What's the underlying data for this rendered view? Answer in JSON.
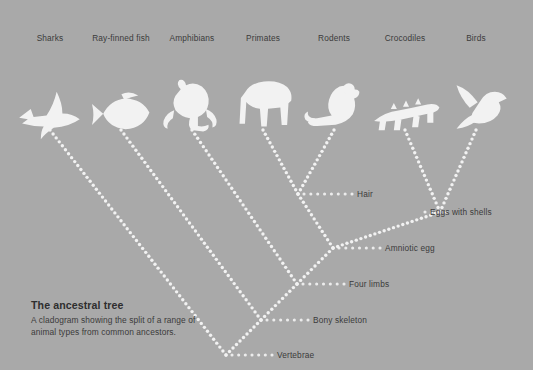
{
  "background_color": "#a9a9a9",
  "silhouette_color": "#f2f2f2",
  "text_color": "#3b3b3b",
  "caption": {
    "title": "The ancestral tree",
    "body": "A cladogram showing the split of a range of animal types from common ancestors."
  },
  "taxa": [
    {
      "label": "Sharks",
      "icon": "shark-silhouette",
      "x": 50
    },
    {
      "label": "Ray-finned fish",
      "icon": "fish-silhouette",
      "x": 121
    },
    {
      "label": "Amphibians",
      "icon": "frog-silhouette",
      "x": 192
    },
    {
      "label": "Primates",
      "icon": "primate-silhouette",
      "x": 263
    },
    {
      "label": "Rodents",
      "icon": "rodent-silhouette",
      "x": 334
    },
    {
      "label": "Crocodiles",
      "icon": "crocodile-silhouette",
      "x": 405
    },
    {
      "label": "Birds",
      "icon": "bird-silhouette",
      "x": 476
    }
  ],
  "nodes": [
    {
      "label": "Hair",
      "x": 298,
      "y": 194,
      "leader_end": 352
    },
    {
      "label": "Eggs with shells",
      "x": 440,
      "y": 212,
      "leader_end": 425
    },
    {
      "label": "Amniotic egg",
      "x": 333,
      "y": 248,
      "leader_end": 380
    },
    {
      "label": "Four limbs",
      "x": 297,
      "y": 284,
      "leader_end": 344
    },
    {
      "label": "Bony skeleton",
      "x": 261,
      "y": 320,
      "leader_end": 308
    },
    {
      "label": "Vertebrae",
      "x": 226,
      "y": 355,
      "leader_end": 272
    }
  ],
  "chart_data": {
    "type": "diagram",
    "diagram_type": "cladogram",
    "title": "The ancestral tree",
    "tip_y": 130,
    "taxa": [
      "Sharks",
      "Ray-finned fish",
      "Amphibians",
      "Primates",
      "Rodents",
      "Crocodiles",
      "Birds"
    ],
    "internal_nodes": [
      {
        "name": "Vertebrae",
        "x": 226,
        "y": 355,
        "children": [
          "Sharks",
          "Bony skeleton"
        ]
      },
      {
        "name": "Bony skeleton",
        "x": 261,
        "y": 320,
        "children": [
          "Ray-finned fish",
          "Four limbs"
        ]
      },
      {
        "name": "Four limbs",
        "x": 297,
        "y": 284,
        "children": [
          "Amphibians",
          "Amniotic egg"
        ]
      },
      {
        "name": "Amniotic egg",
        "x": 333,
        "y": 248,
        "children": [
          "Hair",
          "Eggs with shells"
        ]
      },
      {
        "name": "Hair",
        "x": 298,
        "y": 194,
        "children": [
          "Primates",
          "Rodents"
        ]
      },
      {
        "name": "Eggs with shells",
        "x": 440,
        "y": 212,
        "children": [
          "Crocodiles",
          "Birds"
        ]
      }
    ],
    "line_style": "dotted",
    "branch_angle_deg": 45
  }
}
